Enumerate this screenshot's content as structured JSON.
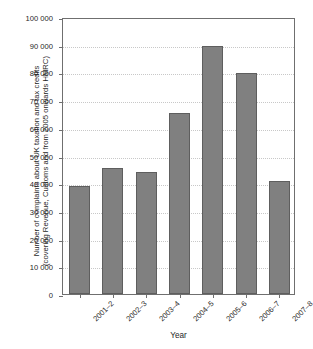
{
  "chart_data": {
    "type": "bar",
    "title": "",
    "subtitle": "",
    "xlabel": "Year",
    "ylabel_line1": "Number of complaints about UK taxation and tax credits",
    "ylabel_line2": "(covering Revenue, Customs and from 2005 onwards HMRC)",
    "categories": [
      "2001–2",
      "2002–3",
      "2003–4",
      "2004–5",
      "2005–6",
      "2006–7",
      "2007–8"
    ],
    "values": [
      39000,
      45500,
      44000,
      65400,
      89700,
      79800,
      40800
    ],
    "ylim": [
      0,
      100000
    ],
    "ytick_values": [
      0,
      10000,
      20000,
      30000,
      40000,
      50000,
      60000,
      70000,
      80000,
      90000,
      100000
    ],
    "ytick_labels": [
      "0",
      "10 000",
      "20 000",
      "30 000",
      "40 000",
      "50 000",
      "60 000",
      "70 000",
      "80 000",
      "90 000",
      "100 000"
    ],
    "grid": true,
    "legend": false,
    "legend_position": "none",
    "bar_color": "#808080",
    "bar_edge_color": "#5e5e5e",
    "grid_color": "#c8c8c8",
    "axis_color": "#6f6f6f",
    "background_color": "#ffffff",
    "annotations": []
  }
}
